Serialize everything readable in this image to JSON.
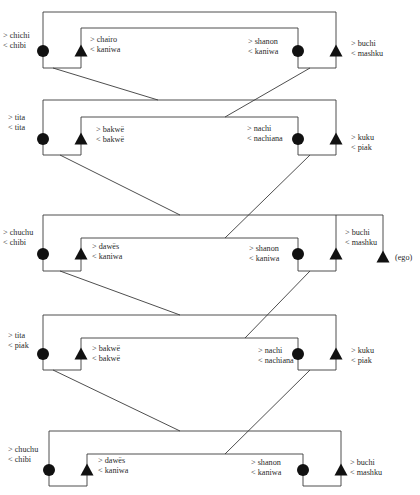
{
  "diagram": {
    "type": "kinship-diagram",
    "line_color": "#3a3a3a",
    "symbol_color": "#111111",
    "ego_label": "(ego)",
    "legend": {
      "circle": "female",
      "triangle": "male",
      "prefix_gt": ">",
      "prefix_lt": "<"
    },
    "generations": [
      {
        "id": 1,
        "outer": {
          "x1": 43,
          "x2": 336,
          "y": 12
        },
        "inner": {
          "x1": 81,
          "x2": 298,
          "y": 28
        },
        "left_box_bottom": 68,
        "right_box_bottom": 68,
        "persons": [
          {
            "sex": "female",
            "x": 43,
            "y": 51,
            "label": {
              "x": 3,
              "y": 31,
              "line1": "> chichi",
              "line2": "< chibi"
            }
          },
          {
            "sex": "male",
            "x": 81,
            "y": 51,
            "label": {
              "x": 90,
              "y": 35,
              "line1": "> chairo",
              "line2": "< kaniwa"
            }
          },
          {
            "sex": "female",
            "x": 298,
            "y": 51,
            "label": {
              "x": 248,
              "y": 37,
              "line1": "> shanon",
              "line2": "< kaniwa"
            }
          },
          {
            "sex": "male",
            "x": 336,
            "y": 51,
            "label": {
              "x": 351,
              "y": 39,
              "line1": "> buchi",
              "line2": "< mashku"
            }
          }
        ]
      },
      {
        "id": 2,
        "outer": {
          "x1": 43,
          "x2": 336,
          "y": 100
        },
        "inner": {
          "x1": 81,
          "x2": 298,
          "y": 117
        },
        "left_box_bottom": 155,
        "right_box_bottom": 155,
        "persons": [
          {
            "sex": "female",
            "x": 43,
            "y": 139,
            "label": {
              "x": 8,
              "y": 113,
              "line1": "> tita",
              "line2": "< tita"
            }
          },
          {
            "sex": "male",
            "x": 81,
            "y": 139,
            "label": {
              "x": 96,
              "y": 125,
              "line1": "> bakwë",
              "line2": "< bakwë"
            }
          },
          {
            "sex": "female",
            "x": 298,
            "y": 139,
            "label": {
              "x": 247,
              "y": 124,
              "line1": "> nachi",
              "line2": "< nachiana"
            }
          },
          {
            "sex": "male",
            "x": 336,
            "y": 139,
            "label": {
              "x": 351,
              "y": 133,
              "line1": "> kuku",
              "line2": "< piak"
            }
          }
        ]
      },
      {
        "id": 3,
        "outer": {
          "x1": 43,
          "x2": 383,
          "y": 215
        },
        "inner": {
          "x1": 81,
          "x2": 298,
          "y": 238
        },
        "left_box_bottom": 271,
        "right_box_bottom": 271,
        "persons": [
          {
            "sex": "female",
            "x": 43,
            "y": 254,
            "label": {
              "x": 3,
              "y": 228,
              "line1": "> chuchu",
              "line2": "< chibi"
            }
          },
          {
            "sex": "male",
            "x": 81,
            "y": 254,
            "label": {
              "x": 92,
              "y": 242,
              "line1": "> dawës",
              "line2": "< kaniwa"
            }
          },
          {
            "sex": "female",
            "x": 298,
            "y": 254,
            "label": {
              "x": 249,
              "y": 244,
              "line1": "> shanon",
              "line2": "< kaniwa"
            }
          },
          {
            "sex": "male",
            "x": 336,
            "y": 254,
            "label": {
              "x": 345,
              "y": 228,
              "line1": "> buchi",
              "line2": "< mashku"
            }
          },
          {
            "sex": "male",
            "x": 383,
            "y": 257,
            "ego": true
          }
        ]
      },
      {
        "id": 4,
        "outer": {
          "x1": 43,
          "x2": 336,
          "y": 315
        },
        "inner": {
          "x1": 81,
          "x2": 298,
          "y": 338
        },
        "left_box_bottom": 370,
        "right_box_bottom": 370,
        "persons": [
          {
            "sex": "female",
            "x": 43,
            "y": 354,
            "label": {
              "x": 8,
              "y": 331,
              "line1": "> tita",
              "line2": "< piak"
            }
          },
          {
            "sex": "male",
            "x": 81,
            "y": 354,
            "label": {
              "x": 92,
              "y": 344,
              "line1": "> bakwë",
              "line2": "< bakwë"
            }
          },
          {
            "sex": "female",
            "x": 298,
            "y": 354,
            "label": {
              "x": 258,
              "y": 346,
              "line1": "> nachi",
              "line2": "< nachiana"
            }
          },
          {
            "sex": "male",
            "x": 336,
            "y": 354,
            "label": {
              "x": 351,
              "y": 346,
              "line1": "> kuku",
              "line2": "< piak"
            }
          }
        ]
      },
      {
        "id": 5,
        "outer": {
          "x1": 49,
          "x2": 341,
          "y": 431
        },
        "inner": {
          "x1": 87,
          "x2": 303,
          "y": 454
        },
        "left_box_bottom": 486,
        "right_box_bottom": 486,
        "persons": [
          {
            "sex": "female",
            "x": 49,
            "y": 470,
            "label": {
              "x": 8,
              "y": 445,
              "line1": "> chuchu",
              "line2": "< chibi"
            }
          },
          {
            "sex": "male",
            "x": 87,
            "y": 470,
            "label": {
              "x": 98,
              "y": 456,
              "line1": "> dawës",
              "line2": "< kaniwa"
            }
          },
          {
            "sex": "female",
            "x": 303,
            "y": 470,
            "label": {
              "x": 251,
              "y": 458,
              "line1": "> shanon",
              "line2": "< kaniwa"
            }
          },
          {
            "sex": "male",
            "x": 341,
            "y": 470,
            "label": {
              "x": 350,
              "y": 458,
              "line1": "> buchi",
              "line2": "< mashku"
            }
          }
        ]
      }
    ],
    "descent_lines": [
      {
        "from": [
          53,
          68
        ],
        "to": [
          158,
          100
        ]
      },
      {
        "from": [
          310,
          68
        ],
        "to": [
          225,
          117
        ]
      },
      {
        "from": [
          60,
          155
        ],
        "to": [
          180,
          215
        ]
      },
      {
        "from": [
          310,
          155
        ],
        "to": [
          225,
          238
        ]
      },
      {
        "from": [
          60,
          271
        ],
        "to": [
          180,
          315
        ]
      },
      {
        "from": [
          310,
          271
        ],
        "to": [
          245,
          338
        ]
      },
      {
        "from": [
          53,
          370
        ],
        "to": [
          180,
          431
        ]
      },
      {
        "from": [
          310,
          370
        ],
        "to": [
          225,
          454
        ]
      }
    ]
  }
}
